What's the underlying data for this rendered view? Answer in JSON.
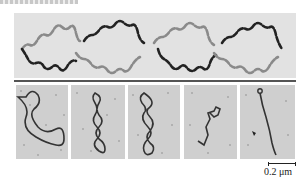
{
  "figure": {
    "top_panel": {
      "description": "Four circular duplex DNA loops drawn as twisted ribbons, each with one dark strand and one grey strand, linked in a chain",
      "loops": 4,
      "strand_colors": {
        "dark": "#222222",
        "light": "#8a8a8a"
      },
      "background": "#e2e2e2"
    },
    "divider_color": "#555555",
    "micrographs": [
      {
        "id": 1,
        "description": "relaxed open circular DNA"
      },
      {
        "id": 2,
        "description": "supercoiled DNA, few twists"
      },
      {
        "id": 3,
        "description": "supercoiled DNA, more twists"
      },
      {
        "id": 4,
        "description": "tightly supercoiled compact DNA"
      },
      {
        "id": 5,
        "description": "highly supercoiled linear-appearing DNA"
      }
    ],
    "scale_bar": {
      "label": "0.2 μm"
    }
  }
}
